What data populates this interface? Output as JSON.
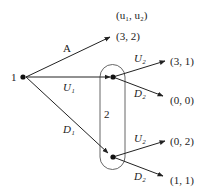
{
  "diagram": {
    "type": "extensive-form game tree",
    "header": {
      "payoff_label": "(u₁, u₂)"
    },
    "player1": {
      "label": "1"
    },
    "player2": {
      "label": "2"
    },
    "actions": {
      "a": "A",
      "u1": "U₁",
      "d1": "D₁",
      "u2_top": "U₂",
      "d2_top": "D₂",
      "u2_bottom": "U₂",
      "d2_bottom": "D₂"
    },
    "payoffs": {
      "a": "(3, 2)",
      "u1_u2": "(3, 1)",
      "u1_d2": "(0, 0)",
      "d1_u2": "(0, 2)",
      "d1_d2": "(1, 1)"
    }
  }
}
